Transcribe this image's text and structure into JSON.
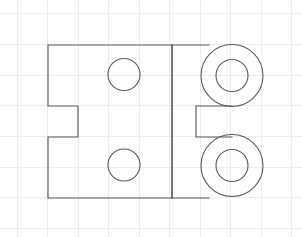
{
  "drawing": {
    "title": "Two-view bracket sketch",
    "description": "Orthographic hand sketch of a notched rectangular bracket plate with two through holes on the left portion and two counterbored bosses on the right portion, drawn on graph paper.",
    "background_color": "#ffffff",
    "line_color": "#5a5a5a",
    "grid_color": "#ebedf1",
    "canvas": {
      "width": 302,
      "height": 237
    },
    "grid": {
      "visible": true,
      "spacing": 30.5,
      "x_lines": [
        17,
        47.5,
        78,
        108.5,
        139,
        169.5,
        200,
        230.5,
        261,
        291.5
      ],
      "y_lines": [
        13.5,
        44.5,
        75,
        105.5,
        136.5,
        167,
        197.5,
        228
      ]
    },
    "left_view": {
      "name": "front-view-plate",
      "outline_points": "48,45 172,45 172,198 48,198 48,137 78,137 78,106 48,106 48,45",
      "holes": [
        {
          "name": "upper-through-hole",
          "cx": 124,
          "cy": 74.5,
          "r": 16
        },
        {
          "name": "lower-through-hole",
          "cx": 124,
          "cy": 165,
          "r": 16
        }
      ],
      "notch": {
        "x": 48,
        "y": 106,
        "width": 30,
        "height": 31
      }
    },
    "divider": {
      "name": "view-separator-line",
      "x": 172,
      "y1": 45,
      "y2": 198
    },
    "right_view": {
      "name": "side-view-bosses",
      "top_edge": {
        "x1": 172,
        "y1": 45,
        "x2": 208,
        "y2": 45
      },
      "bottom_edge": {
        "x1": 172,
        "y1": 198,
        "x2": 208,
        "y2": 198
      },
      "notch": {
        "x": 196,
        "y": 106,
        "width": 36,
        "height": 31
      },
      "notch_path": "232,106 196,106 196,137 232,137",
      "bosses": [
        {
          "name": "upper-boss",
          "cx": 232,
          "cy": 75.5,
          "outer_r": 31,
          "inner_r": 16
        },
        {
          "name": "lower-boss",
          "cx": 232,
          "cy": 165.5,
          "outer_r": 31,
          "inner_r": 16
        }
      ]
    }
  }
}
